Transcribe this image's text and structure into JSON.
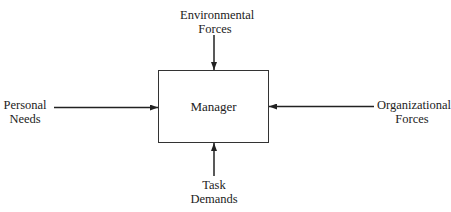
{
  "diagram": {
    "center": {
      "label": "Manager"
    },
    "inputs": [
      {
        "id": "top",
        "line1": "Environmental",
        "line2": "Forces"
      },
      {
        "id": "left",
        "line1": "Personal",
        "line2": "Needs"
      },
      {
        "id": "right",
        "line1": "Organizational",
        "line2": "Forces"
      },
      {
        "id": "bottom",
        "line1": "Task",
        "line2": "Demands"
      }
    ],
    "colors": {
      "stroke": "#222222",
      "background": "#ffffff"
    }
  }
}
